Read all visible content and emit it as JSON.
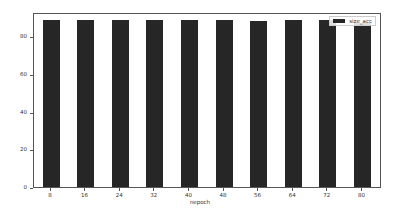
{
  "chart_data": {
    "type": "bar",
    "title": "",
    "xlabel": "nepoch",
    "ylabel": "",
    "categories": [
      "8",
      "16",
      "24",
      "32",
      "40",
      "48",
      "56",
      "64",
      "72",
      "80"
    ],
    "series": [
      {
        "name": "size_acc",
        "values": [
          89,
          89,
          89,
          89,
          89,
          89,
          88,
          89,
          89,
          87
        ],
        "color": "#262626"
      }
    ],
    "yticks": [
      "0",
      "20",
      "40",
      "60",
      "80"
    ],
    "ylim": [
      0,
      93
    ],
    "grid": false,
    "legend_position": "upper right"
  }
}
